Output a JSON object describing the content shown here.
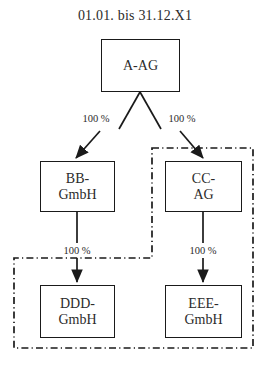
{
  "diagram": {
    "title": "01.01. bis 31.12.X1",
    "type": "org-chart",
    "nodes": [
      {
        "id": "a",
        "label": "A-AG"
      },
      {
        "id": "bb",
        "label": "BB-\nGmbH"
      },
      {
        "id": "cc",
        "label": "CC-\nAG"
      },
      {
        "id": "ddd",
        "label": "DDD-\nGmbH"
      },
      {
        "id": "eee",
        "label": "EEE-\nGmbH"
      }
    ],
    "edges": [
      {
        "id": "a-bb",
        "from": "a",
        "to": "bb",
        "label": "100 %"
      },
      {
        "id": "a-cc",
        "from": "a",
        "to": "cc",
        "label": "100 %"
      },
      {
        "id": "bb-ddd",
        "from": "bb",
        "to": "ddd",
        "label": "100 %"
      },
      {
        "id": "cc-eee",
        "from": "cc",
        "to": "eee",
        "label": "100 %"
      }
    ],
    "groups": [
      {
        "id": "consolidation-group",
        "style": "dash-dot",
        "members": [
          "cc",
          "ddd",
          "eee"
        ]
      }
    ],
    "colors": {
      "stroke": "#1a1a1a",
      "text": "#2b2b2b",
      "group_border": "#1a1a1a",
      "background": "#ffffff"
    }
  }
}
